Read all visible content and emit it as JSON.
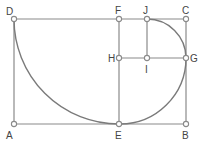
{
  "diagram": {
    "colors": {
      "line": "#8a8a8a",
      "arc": "#7a7a7a",
      "point_fill": "#ffffff",
      "label": "#444444"
    },
    "points": [
      {
        "id": "A",
        "label": "A",
        "x": 14,
        "y": 124,
        "lx": 6,
        "ly": 139
      },
      {
        "id": "B",
        "label": "B",
        "x": 186,
        "y": 124,
        "lx": 182,
        "ly": 139
      },
      {
        "id": "C",
        "label": "C",
        "x": 186,
        "y": 19,
        "lx": 182,
        "ly": 14
      },
      {
        "id": "D",
        "label": "D",
        "x": 14,
        "y": 19,
        "lx": 6,
        "ly": 15
      },
      {
        "id": "E",
        "label": "E",
        "x": 119,
        "y": 124,
        "lx": 115,
        "ly": 139
      },
      {
        "id": "F",
        "label": "F",
        "x": 119,
        "y": 19,
        "lx": 115,
        "ly": 14
      },
      {
        "id": "G",
        "label": "G",
        "x": 186,
        "y": 58,
        "lx": 190,
        "ly": 62
      },
      {
        "id": "H",
        "label": "H",
        "x": 119,
        "y": 58,
        "lx": 108,
        "ly": 62
      },
      {
        "id": "I",
        "label": "I",
        "x": 147,
        "y": 58,
        "lx": 145,
        "ly": 73
      },
      {
        "id": "J",
        "label": "J",
        "x": 147,
        "y": 19,
        "lx": 143,
        "ly": 14
      }
    ],
    "segments": [
      [
        "A",
        "B"
      ],
      [
        "B",
        "C"
      ],
      [
        "C",
        "D"
      ],
      [
        "D",
        "A"
      ],
      [
        "E",
        "F"
      ],
      [
        "H",
        "G"
      ],
      [
        "J",
        "I"
      ]
    ],
    "arcs": [
      {
        "from": "D",
        "to": "E",
        "center": "F",
        "radius": 105
      },
      {
        "from": "E",
        "to": "G",
        "center": "H",
        "radius": 66
      },
      {
        "from": "G",
        "to": "J",
        "center": "I",
        "radius": 39
      }
    ]
  }
}
